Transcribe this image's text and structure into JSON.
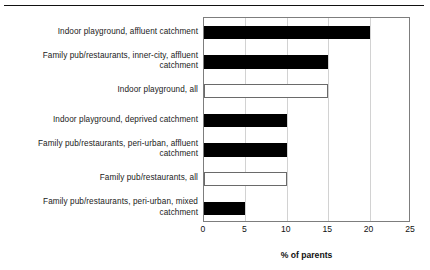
{
  "chart_data": {
    "type": "bar",
    "orientation": "horizontal",
    "title": "",
    "xlabel": "% of parents",
    "ylabel": "",
    "xlim": [
      0,
      25
    ],
    "xticks": [
      0,
      5,
      10,
      15,
      20,
      25
    ],
    "grid": true,
    "legend": null,
    "categories": [
      "Indoor playground, affluent catchment",
      "Family pub/restaurants, inner-city, affluent catchment",
      "Indoor playground, all",
      "Indoor playground, deprived catchment",
      "Family pub/restaurants, peri-urban, affluent catchment",
      "Family pub/restaurants, all",
      "Family pub/restaurants, peri-urban, mixed catchment"
    ],
    "values": [
      20,
      15,
      15,
      10,
      10,
      10,
      5
    ],
    "bar_styles": [
      "filled",
      "filled",
      "hollow",
      "filled",
      "filled",
      "hollow",
      "filled"
    ],
    "colors": {
      "filled": "#000000",
      "hollow_fill": "#ffffff",
      "hollow_stroke": "#6a6a6a",
      "grid": "#d2d2d2",
      "frame": "#7d7d7d",
      "text": "#111111"
    }
  },
  "figure": {
    "top_rule": true
  },
  "axis": {
    "tick_labels": [
      "0",
      "5",
      "10",
      "15",
      "20",
      "25"
    ],
    "title": "% of parents"
  }
}
